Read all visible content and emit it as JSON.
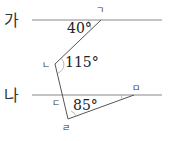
{
  "diagram": {
    "lines": [
      {
        "name": "가",
        "label": "가"
      },
      {
        "name": "나",
        "label": "나"
      }
    ],
    "points": {
      "p1": "ㄱ",
      "p2": "ㄴ",
      "p3": "ㄷ",
      "p4": "ㄹ",
      "p5": "ㅁ"
    },
    "angles": {
      "a1": "40°",
      "a2": "115°",
      "a3": "85°"
    },
    "colors": {
      "line": "#777777",
      "text": "#222222"
    }
  }
}
